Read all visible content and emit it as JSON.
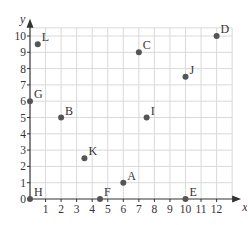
{
  "chart_data": {
    "type": "scatter",
    "title": "",
    "xlabel": "x",
    "ylabel": "y",
    "xlim": [
      0,
      13
    ],
    "ylim": [
      0,
      10.5
    ],
    "grid": true,
    "legend": "none",
    "x_ticks": [
      1,
      2,
      3,
      4,
      5,
      6,
      7,
      8,
      9,
      10,
      11,
      12
    ],
    "y_ticks": [
      0,
      1,
      2,
      3,
      4,
      5,
      6,
      7,
      8,
      9,
      10
    ],
    "points": [
      {
        "label": "A",
        "x": 6,
        "y": 1
      },
      {
        "label": "B",
        "x": 2,
        "y": 5
      },
      {
        "label": "C",
        "x": 7,
        "y": 9
      },
      {
        "label": "D",
        "x": 12,
        "y": 10
      },
      {
        "label": "E",
        "x": 10,
        "y": 0
      },
      {
        "label": "F",
        "x": 4.5,
        "y": 0
      },
      {
        "label": "G",
        "x": 0,
        "y": 6
      },
      {
        "label": "H",
        "x": 0,
        "y": 0
      },
      {
        "label": "I",
        "x": 7.5,
        "y": 5
      },
      {
        "label": "J",
        "x": 10,
        "y": 7.5
      },
      {
        "label": "K",
        "x": 3.5,
        "y": 2.5
      },
      {
        "label": "L",
        "x": 0.5,
        "y": 9.5
      }
    ]
  },
  "colors": {
    "grid": "#d9d9d9",
    "axis": "#333333",
    "point": "#555555",
    "text": "#333333"
  }
}
